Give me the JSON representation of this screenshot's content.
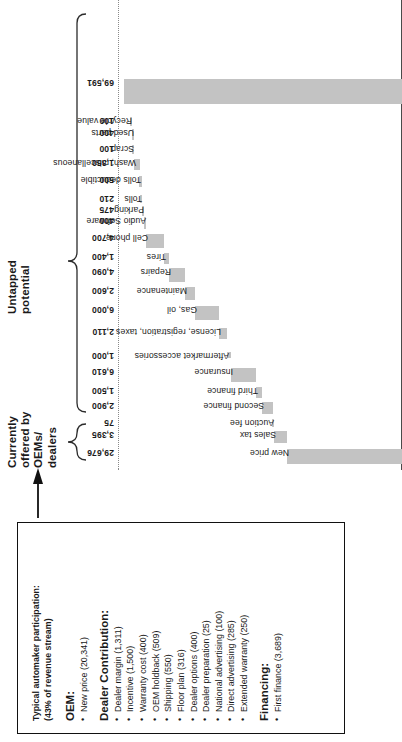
{
  "chart_data": {
    "type": "bar",
    "chart_style": "waterfall",
    "title": "",
    "xlabel": "",
    "ylabel": "",
    "orientation": "vertical-bars-rotated",
    "grid": false,
    "baseline_label": "dotted top reference line",
    "categories": [
      "New price",
      "Sales tax",
      "Auction fee",
      "Second finance",
      "Third finance",
      "Insurance",
      "Aftermarket accessories",
      "License, registration, taxes",
      "Gas, oil",
      "Maintenance",
      "Repairs",
      "Tires",
      "Cell phone",
      "Audio Software",
      "Parking",
      "Tolls",
      "Tolls deductible",
      "Wash, miscellaneous",
      "Scrap",
      "Used parts",
      "Recycle value"
    ],
    "values": [
      29676,
      3395,
      75,
      2900,
      1500,
      6610,
      1000,
      2110,
      6000,
      2600,
      4090,
      1400,
      4700,
      400,
      475,
      210,
      500,
      1350,
      100,
      400,
      100
    ],
    "value_labels": [
      "29,676",
      "3,395",
      "75",
      "2,900",
      "1,500",
      "6,610",
      "1,000",
      "2,110",
      "6,000",
      "2,600",
      "4,090",
      "1,400",
      "4,700",
      "400",
      "475",
      "210",
      "500",
      "1,350",
      "100",
      "400",
      "100"
    ],
    "total_label": "69,591",
    "total_value": 69591,
    "ylim": [
      0,
      69591
    ],
    "bar_color": "#c3c3c3",
    "brackets": [
      {
        "label": "Currently offered by\nOEMs/\ndealers",
        "covers": [
          "New price"
        ]
      },
      {
        "label": "Untapped\npotential",
        "covers": [
          "Sales tax",
          "Recycle value"
        ]
      }
    ]
  },
  "brackets": {
    "offered": "Currently\noffered by\nOEMs/\ndealers",
    "untapped": "Untapped\npotential"
  },
  "bars": [
    {
      "label": "New price",
      "value_label": "29,676",
      "value": 29676
    },
    {
      "label": "Sales tax",
      "value_label": "3,395",
      "value": 3395
    },
    {
      "label": "Auction fee",
      "value_label": "75",
      "value": 75
    },
    {
      "label": "Second finance",
      "value_label": "2,900",
      "value": 2900
    },
    {
      "label": "Third finance",
      "value_label": "1,500",
      "value": 1500
    },
    {
      "label": "Insurance",
      "value_label": "6,610",
      "value": 6610
    },
    {
      "label": "Aftermarket accessories",
      "value_label": "1,000",
      "value": 1000
    },
    {
      "label": "License, registration, taxes",
      "value_label": "2,110",
      "value": 2110
    },
    {
      "label": "Gas, oil",
      "value_label": "6,000",
      "value": 6000
    },
    {
      "label": "Maintenance",
      "value_label": "2,600",
      "value": 2600
    },
    {
      "label": "Repairs",
      "value_label": "4,090",
      "value": 4090
    },
    {
      "label": "Tires",
      "value_label": "1,400",
      "value": 1400
    },
    {
      "label": "Cell phone",
      "value_label": "4,700",
      "value": 4700
    },
    {
      "label": "Audio Software",
      "value_label": "400",
      "value": 400
    },
    {
      "label": "Parking",
      "value_label": "475",
      "value": 475
    },
    {
      "label": "Tolls",
      "value_label": "210",
      "value": 210
    },
    {
      "label": "Tolls deductible",
      "value_label": "500",
      "value": 500
    },
    {
      "label": "Wash, miscellaneous",
      "value_label": "1,350",
      "value": 1350
    },
    {
      "label": "Scrap",
      "value_label": "100",
      "value": 100
    },
    {
      "label": "Used parts",
      "value_label": "400",
      "value": 400
    },
    {
      "label": "Recycle value",
      "value_label": "100",
      "value": 100
    },
    {
      "label": "",
      "value_label": "69,591",
      "value": 69591,
      "is_total": true
    }
  ],
  "callout": {
    "title": "Typical automaker participation:\n(43% of revenue stream)",
    "sections": [
      {
        "heading": "OEM:",
        "items": [
          "New price (20,341)"
        ]
      },
      {
        "heading": "Dealer Contribution:",
        "items": [
          "Dealer margin (1,311)",
          "Incentive (1,500)",
          "Warranty cost (400)",
          "OEM holdback (509)",
          "Shipping (550)",
          "Floor plan (316)",
          "Dealer options (400)",
          "Dealer preparation (25)",
          "National advertising (100)",
          "Direct advertising (285)",
          "Extended warranty (250)"
        ]
      },
      {
        "heading": "Financing:",
        "items": [
          "First finance (3,689)"
        ]
      }
    ]
  },
  "colors": {
    "bar": "#c3c3c3",
    "line": "#4a4a4a",
    "text": "#1a1a1a"
  }
}
